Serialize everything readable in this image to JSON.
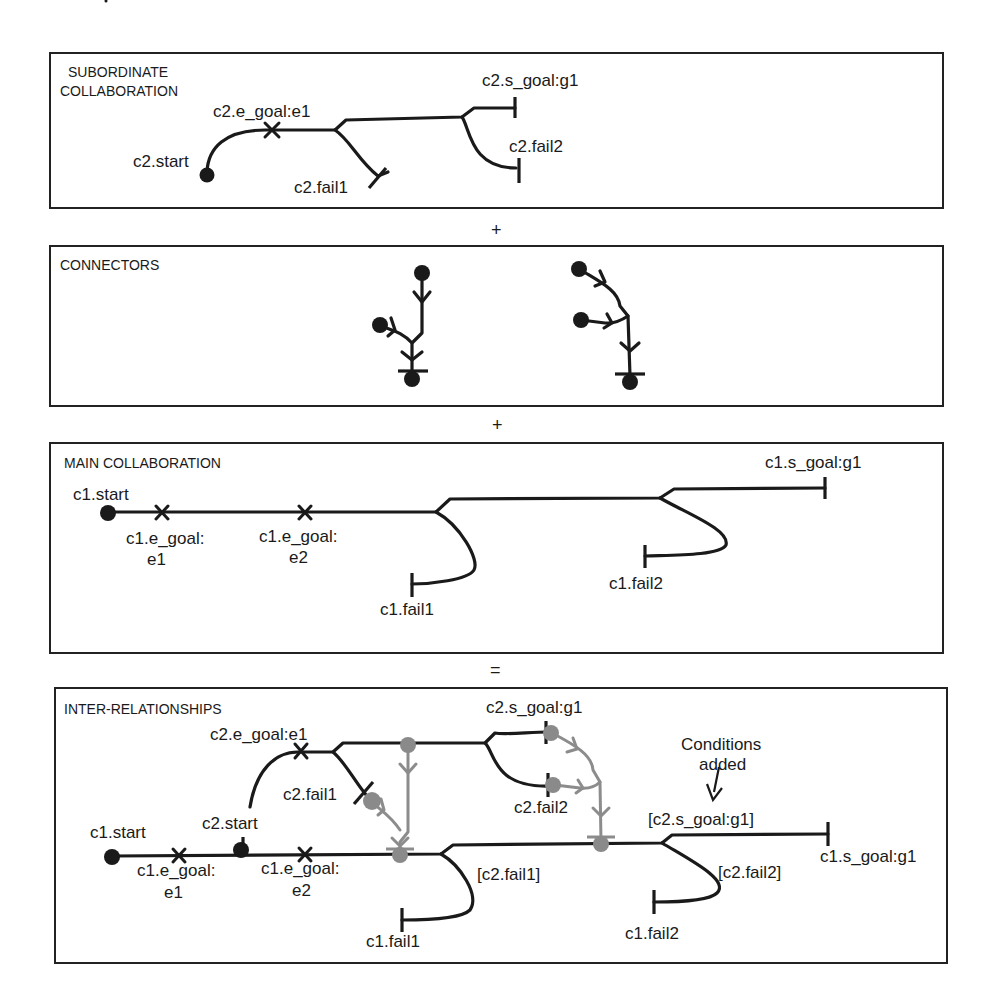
{
  "panels": {
    "subordinate": {
      "title_line1": "SUBORDINATE",
      "title_line2": "COLLABORATION",
      "labels": {
        "start": "c2.start",
        "e_goal": "c2.e_goal:e1",
        "fail1": "c2.fail1",
        "s_goal": "c2.s_goal:g1",
        "fail2": "c2.fail2"
      }
    },
    "connectors": {
      "title": "CONNECTORS"
    },
    "main": {
      "title": "MAIN COLLABORATION",
      "labels": {
        "start": "c1.start",
        "e_goal1_line1": "c1.e_goal:",
        "e_goal1_line2": "e1",
        "e_goal2_line1": "c1.e_goal:",
        "e_goal2_line2": "e2",
        "fail1": "c1.fail1",
        "s_goal": "c1.s_goal:g1",
        "fail2": "c1.fail2"
      }
    },
    "inter": {
      "title": "INTER-RELATIONSHIPS",
      "labels": {
        "c1_start": "c1.start",
        "c2_start": "c2.start",
        "c2_e_goal": "c2.e_goal:e1",
        "c2_fail1": "c2.fail1",
        "c2_s_goal": "c2.s_goal:g1",
        "c2_fail2": "c2.fail2",
        "c1_e_goal1_line1": "c1.e_goal:",
        "c1_e_goal1_line2": "e1",
        "c1_e_goal2_line1": "c1.e_goal:",
        "c1_e_goal2_line2": "e2",
        "cond_fail1": "[c2.fail1]",
        "c1_fail1": "c1.fail1",
        "cond_s_goal": "[c2.s_goal:g1]",
        "cond_fail2": "[c2.fail2]",
        "c1_fail2": "c1.fail2",
        "c1_s_goal": "c1.s_goal:g1",
        "annotation_line1": "Conditions",
        "annotation_line2": "added"
      }
    }
  },
  "operators": {
    "plus1": "+",
    "plus2": "+",
    "equals": "="
  },
  "colors": {
    "line": "#1a1a1a",
    "connector_gray": "#8c8c8c",
    "background": "#ffffff"
  }
}
